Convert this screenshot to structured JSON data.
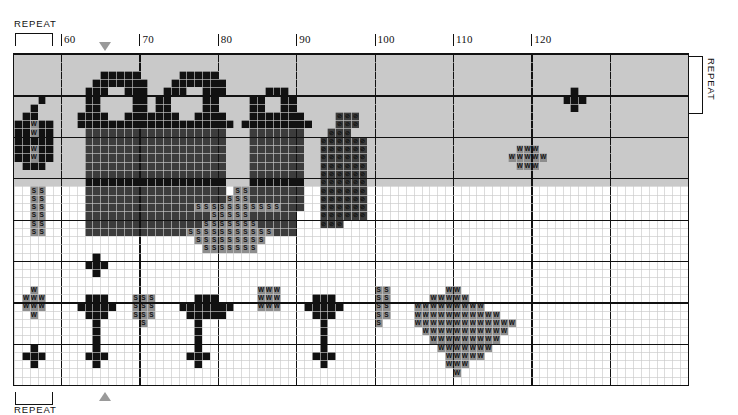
{
  "chart_data": {
    "type": "heatmap",
    "xlabel": "",
    "ylabel": "",
    "grid": true,
    "legend_position": "none",
    "columns": 86,
    "rows": 40,
    "col_start": 54,
    "col_end": 139,
    "xticks": [
      60,
      70,
      80,
      90,
      100,
      110,
      120
    ],
    "xlim": [
      54,
      139
    ],
    "major_every": 10,
    "palette": {
      "empty": "#ffffff",
      "light": "#c9c9c9",
      "mid": "#8d8d8d",
      "dark": "#3c3c3c",
      "black": "#111111",
      "gridline": "#c9c9c9",
      "gridline_major": "#111111",
      "marker": "#9a9a9a"
    },
    "symbols": {
      "w": "W",
      "s": "S",
      "o": "O",
      "dot": "■",
      "slash": "⊘"
    },
    "rows_data": [
      "LLLLLLLLLLLLLLLLLLLLLLLLLLLLLLLLLLLLLLLLLLLLLLLLLLLLLLLLLLLLLLLLLLLLLLLLLLLLLLLLLLLLLL",
      "LLLLLLLLLLLLLLLLLLLLLLLLLLLLLLLLLLLLLLLLLLLLLLLLLLLLLLLLLLLLLLLLLLLLLLLLLLLLLLLLLLLLLL",
      "LLLLLLLLLLLKKKKKLLLLLKKKKKLLLLLLLLLLLLLLLLLLLLLLLLLLLLLLLLLLLLLLLLLLLLLLLLLLLLLLLLLLLL",
      "LLLLLLLLLLKKKKKKKLLLKKKKKKKLLLLLLLLLLLLLLLLLLLLLLLLLLLLLLLLLLLLLLLLLLLLLLLLLLLLLLLLLLL",
      "LLLLLLLLLKKKLLKKKLLKKKLLKKKLLLLLKKKLLLLLLLLLLLLLLLLLLLLLLLLLLLLLLLLLLLLKLLLLLLLLLLLLLL",
      "LLLKLLLLLKKLLLLKKLKKLLLLKKLLLLKKLLKKLLLLLLLLLLLLLLLLLLLLLLLLLLLLLLLLLLKKKLLLLLLLLLLLLL",
      "LLKLLLLLLKKLLLLKKLKKLLLLKKLLLLKKLLKKLLLLLLLLLLLLLLLLLLLLLLLLLLLLLLLLLLLKLLLLLLLLLLLLLL",
      "LKKLLLLLKKKKLLKKKKKKKLLKKKKLLLKKKKKKKLLLLOOOLLLLLLLLLLLLLLLLLLLLLLLLLLLLLLLLLLLLLLLLLL",
      "KKWKKLLLKKKKKKKKKKKKKKKKKKKKLKKKKKKKKKLLLOOOLLLLLLLLLLLLLLLLLLLLLLLLLLLLLLLLLLLLLLLLLL",
      "KKWKKLLLLDDDDDDDDDDDDDDDDDDLLLDDDDDDDLLLOOOLLLLLLLLLLLLLLLLLLLLLLLLLLLLLLLLLLLLLLLLLLL",
      "KKKKKLLLLDDDDDDDDDDDDDDDDDDLLLDDDDDDDLLOOOOOOLLLLLLLLLLLLLLLLLLLLLLLLLLLLLLLLLLLLLLLLL",
      "KKWKKLLLLDDDDDDDDDDDDDDDDDDLLLDDDDDDDLLOOOOOOLLLLLLLLLLLLLLLLLLLWWWLLLLLLLLLLLLLLLLLLL",
      "KKWKKLLLLDDDDDDDDDDDDDDDDDDLLLDDDDDDDLLOOOOOOLLLLLLLLLLLLLLLLLLWWWWWLLLLLLLLLLLLLLLLLL",
      "LKKKLLLLLDDDDDDDDDDDDDDDDDDLLLDDDDDDDLLOOOOOOLLLLLLLLLLLLLLLLLLLWWWLLLLLLLLLLLLLLLLLLL",
      "LLLLLLLLLDDDDDDDDDDDDDDDDDDLLLDDDDDDDLLOOOOOOLLLLLLLLLLLLLLLLLLLLLLLLLLLLLLLLLLLLLLLLL",
      "LLLLLLLLLKKKKKKKKKKKKKKKKKKLLLKKKKKKKLLOOOOOOLLLLLLLLLLLLLLLLLLLLLLLLLLLLLLLLLLLLLLLLL",
      "LLSSLLLLLDDDDDDDDDDDDDDDDDDLSSDDDDDDDLLOOOOOOLLLLLLLLLLLLLLLLLLLLLLLLLLLLLLLLLLLLLLLLL",
      "LLSSLLLLLDDDDDDDDDDDDDDDDDDSSSDDDDDDDLLOOOOOOLLLLLLLLLLLLLLLLLLLLLLLLLLLLLLLLLLLLLLLLL",
      "LLSSLLLLLDDDDDDDDDDDDDDSSSSSSSSSSSDDDLLOOOOOOLLLLLLLLLLLLLLLLLLLLLLLLLLLLLLLLLLLLLLLLL",
      "LLSSLLLLLDDDDDDDDDDDDDDDDSSSSSDDDDDDLLLOOOOOOLLLLLLLLLLLLLLLLLLLLLLLLLLLLLLLLLLLLLLLLL",
      "LLSSLLLLLDDDDDDDDDDDDDDDSSSSSSSDDDDDLLLOOOLLLLLLLLLLLLLLLLLLLLLLLLLLLLLLLLLLLLLLLLLLLL",
      "LLSSLLLLLDDDDDDDDDDDDDSSSSSSSSSSSDDDLLLLLLLLLLLLLLLLLLLLLLLLLLLLLLLLLLLLLLLLLLLLLLLLLL",
      "LLLLLLLLLLLLLLLLLLLLLLLSSSSSSSSSLLLLLLLLLLLLLLLLLLLLLLLLLLLLLLLLLLLLLLLLLLLLLLLLLLLLLL",
      "LLLLLLLLLLLLLLLLLLLLLLLLSSSSSSSLLLLLLLLLLLLLLLLLLLLLLLLLLLLLLLLLLLLLLLLLLLLLLLLLLLLLLL",
      "LLLLLLLLLLKLLLLLLLLLLLLLLLLLLLLLLLLLLLLLLLLLLLLLLLLLLLLLLLLLLLLLLLLLLLLLLLLLLLLLLLLLLL",
      "LLLLLLLLLKKKLLLLLLLLLLLLLLLLLLLLLLLLLLLLLLLLLLLLLLLLLLLLLLLLLLLLLLLLLLLLLLLLLLLLLLLLLL",
      "LLLLLLLLLLKLLLLLLLLLLLLLLLLLLLLLLLLLLLLLLLLLLLLLLLLLLLLLLLLLLLLLLLLLLLLLLLLLLLLLLLLLLL",
      "LLLLLLLLLLLLLLLLLLLLLLLLLLLLLLLLLLLLLLLLLLLLLLLLLLLLLLLLLLLLLLLLLLLLLLLLLLLLLLLLLLLLLL",
      "LLWLLLLLLLLLLLLLLLLLLLLLLLLLLLLWWWLLLLLLLLLLLLSSLLLLLLLWWLLLLLLLLLLLLLLLLLLLLLLLLLLLLL",
      "LWWWLLLLLKKKLLLSSSLLLLLKKKLLLLLWWWLLLLKKKLLLLLSSLLLLLWWWWWLLLLLLLLLLLLLLLLLLLLLLLLLLLL",
      "LWWWLLLLKKKKKLLSSSLLLKKKKKKKLLLWWWLLLKKKKKLLLLSSLLLWWWWWWWWWLLLLLLLLLLLLLLLLLLLLLLLLLL",
      "LLWLLLLLLKKKLLLSSSLLLLKKKKKLLLLLLLLLLLKKKLLLLLSSLLLWWWWWWWWWWWLLLLLLLLLLLLLLLLLLLLLLLL",
      "LLLLLLLLLLKLLLLLSLLLLLLKLLLLLLLLLLLLLLLKLLLLLLSLLLLWWWWWWWWWWWWWLLLLLLLLLLLLLLLLLLLLLL",
      "LLLLLLLLLLKLLLLLLLLLLLLKLLLLLLLLLLLLLLLKLLLLLLLLLLLLWWWWWWWWWWWLLLLLLLLLLLLLLLLLLLLLLL",
      "LLLLLLLLLLKLLLLLLLLLLLLKLLLLLLLLLLLLLLLKLLLLLLLLLLLLLWWWWWWWWWLLLLLLLLLLLLLLLLLLLLLLLL",
      "LLKLLLLLLLKLLLLLLLLLLLLKLLLLLLLLLLLLLLLKLLLLLLLLLLLLLLWWWWWWWLLLLLLLLLLLLLLLLLLLLLLLLL",
      "LKKKLLLLLKKKLLLLLLLLLLKKKLLLLLLLLLLLLLKKKLLLLLLLLLLLLLLWWWWWLLLLLLLLLLLLLLLLLLLLLLLLLL",
      "LLKLLLLLLLKLLLLLLLLLLLLKLLLLLLLLLLLLLLLKLLLLLLLLLLLLLLLWWWLLLLLLLLLLLLLLLLLLLLLLLLLLLL",
      "LLLLLLLLLLLLLLLLLLLLLLLLLLLLLLLLLLLLLLLLLLLLLLLLLLLLLLLLWLLLLLLLLLLLLLLLLLLLLLLLLLLLLL",
      "LLLLLLLLLLLLLLLLLLLLLLLLLLLLLLLLLLLLLLLLLLLLLLLLLLLLLLLLLLLLLLLLLLLLLLLLLLLLLLLLLLLLLL"
    ]
  },
  "header": {
    "repeat_top_label": "REPEAT",
    "repeat_bottom_label": "REPEAT",
    "repeat_right_label": "REPEAT"
  },
  "markers": {
    "top_triangle": "▼",
    "bottom_triangle": "▲",
    "top_triangle_column": 67,
    "bottom_triangle_column": 67
  },
  "ticks": {
    "labels": [
      "60",
      "70",
      "80",
      "90",
      "100",
      "110",
      "120"
    ],
    "values": [
      60,
      70,
      80,
      90,
      100,
      110,
      120
    ]
  }
}
